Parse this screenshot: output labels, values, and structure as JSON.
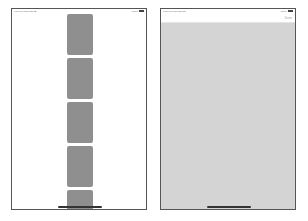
{
  "left_screen": {
    "status": {
      "time": "7:56 PM Thu Jan 28",
      "battery": "100%"
    },
    "tiles": [
      {
        "top": 5,
        "height": 41
      },
      {
        "top": 49,
        "height": 41
      },
      {
        "top": 93,
        "height": 41
      },
      {
        "top": 137,
        "height": 41
      },
      {
        "top": 181,
        "height": 25
      }
    ],
    "colors": {
      "tile": "#8f8f8f",
      "background": "#ffffff"
    }
  },
  "right_screen": {
    "status": {
      "time": "7:56 PM Thu Jan 28",
      "battery": "100%"
    },
    "nav": {
      "done_label": "Done"
    },
    "colors": {
      "content": "#d4d4d4",
      "nav": "#ffffff"
    }
  }
}
